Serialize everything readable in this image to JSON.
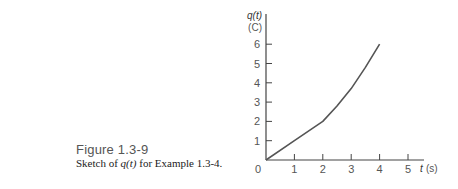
{
  "figure": {
    "number": "Figure 1.3-9",
    "description_prefix": "Sketch of ",
    "description_var": "q(t)",
    "description_suffix": " for Example 1.3-4."
  },
  "chart_data": {
    "type": "line",
    "title": "",
    "xlabel": "t (s)",
    "ylabel": "q(t) (C)",
    "ylabel_line1": "q(t)",
    "ylabel_line2": "(C)",
    "xlabel_var": "t",
    "xlabel_unit": "(s)",
    "x_ticks": [
      "0",
      "1",
      "2",
      "3",
      "4",
      "5"
    ],
    "y_ticks": [
      "1",
      "2",
      "3",
      "4",
      "5",
      "6"
    ],
    "xlim": [
      0,
      5.3
    ],
    "ylim": [
      0,
      6.5
    ],
    "grid": false,
    "series": [
      {
        "name": "q(t)",
        "x": [
          0,
          1,
          2,
          2.5,
          3,
          3.5,
          4
        ],
        "y": [
          0,
          1,
          2,
          2.8,
          3.7,
          4.8,
          6
        ]
      }
    ],
    "line_color": "#555555"
  }
}
